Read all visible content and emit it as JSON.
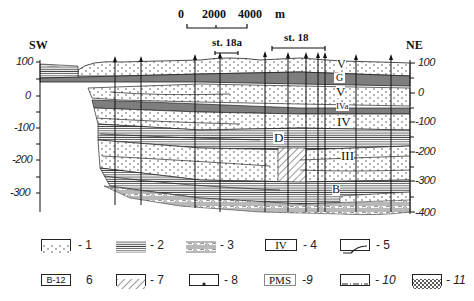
{
  "scale_bar": {
    "labels": [
      "0",
      "2000",
      "4000"
    ],
    "unit": "m"
  },
  "direction": {
    "left": "SW",
    "right": "NE"
  },
  "stations": [
    {
      "label": "st. 18a"
    },
    {
      "label": "st. 18"
    }
  ],
  "left_axis": {
    "ticks": [
      "100",
      "0",
      "-100",
      "-200",
      "-300"
    ]
  },
  "right_axis": {
    "ticks": [
      "100",
      "0",
      "-100",
      "-200",
      "-300",
      "-400"
    ]
  },
  "unit_labels": {
    "v_top": "V",
    "g": "G",
    "v_mid": "V",
    "iva": "IVa",
    "iv": "IV",
    "d": "D",
    "iii": "III",
    "b": "B"
  },
  "legend": [
    {
      "id": "1",
      "label": "- 1",
      "pattern": "dotted-sand"
    },
    {
      "id": "2",
      "label": "- 2",
      "pattern": "horizontal-lines"
    },
    {
      "id": "3",
      "label": "- 3",
      "pattern": "lines-with-lenses"
    },
    {
      "id": "4",
      "label": "- 4",
      "pattern": "roman-numeral-box",
      "box_text": "IV"
    },
    {
      "id": "5",
      "label": "- 5",
      "pattern": "boundary-curve"
    },
    {
      "id": "6",
      "label": "6",
      "pattern": "sample-box",
      "box_text": "B-12"
    },
    {
      "id": "7",
      "label": "- 7",
      "pattern": "diagonal-hatch"
    },
    {
      "id": "8",
      "label": "- 8",
      "pattern": "single-dot"
    },
    {
      "id": "9",
      "label": "-9",
      "pattern": "text-box",
      "box_text": "PMS"
    },
    {
      "id": "10",
      "label": "- 10",
      "pattern": "dash-dot-line"
    },
    {
      "id": "11",
      "label": "- 11",
      "pattern": "cross-hatch"
    }
  ],
  "colors": {
    "ink": "#222222",
    "background": "#ffffff",
    "grey_band": "#9a9a9a"
  }
}
